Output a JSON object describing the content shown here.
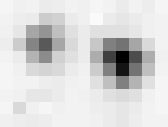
{
  "chart_data": {
    "type": "heatmap",
    "title": "",
    "xlabel": "",
    "ylabel": "",
    "colormap": "grayscale (white=0, black=1)",
    "rows": 10,
    "cols": 13,
    "values": [
      [
        0.04,
        0.06,
        0.05,
        0.08,
        0.07,
        0.05,
        0.06,
        0.04,
        0.05,
        0.08,
        0.05,
        0.07,
        0.04
      ],
      [
        0.05,
        0.07,
        0.08,
        0.2,
        0.18,
        0.08,
        0.06,
        0.02,
        0.08,
        0.1,
        0.08,
        0.06,
        0.05
      ],
      [
        0.06,
        0.1,
        0.35,
        0.42,
        0.25,
        0.12,
        0.08,
        0.12,
        0.12,
        0.12,
        0.1,
        0.06,
        0.05
      ],
      [
        0.07,
        0.2,
        0.48,
        0.65,
        0.35,
        0.15,
        0.08,
        0.22,
        0.5,
        0.55,
        0.35,
        0.15,
        0.05
      ],
      [
        0.05,
        0.08,
        0.3,
        0.45,
        0.18,
        0.12,
        0.08,
        0.32,
        0.75,
        1.0,
        0.7,
        0.32,
        0.06
      ],
      [
        0.04,
        0.06,
        0.15,
        0.17,
        0.15,
        0.08,
        0.06,
        0.2,
        0.5,
        0.92,
        0.55,
        0.25,
        0.05
      ],
      [
        0.04,
        0.05,
        0.05,
        0.07,
        0.08,
        0.06,
        0.05,
        0.12,
        0.25,
        0.5,
        0.3,
        0.12,
        0.04
      ],
      [
        0.05,
        0.06,
        0.1,
        0.1,
        0.08,
        0.05,
        0.06,
        0.08,
        0.12,
        0.14,
        0.12,
        0.06,
        0.04
      ],
      [
        0.04,
        0.15,
        0.06,
        0.04,
        0.06,
        0.05,
        0.05,
        0.07,
        0.08,
        0.1,
        0.08,
        0.05,
        0.04
      ],
      [
        0.06,
        0.07,
        0.08,
        0.07,
        0.05,
        0.05,
        0.05,
        0.06,
        0.08,
        0.1,
        0.07,
        0.05,
        0.05
      ]
    ]
  }
}
